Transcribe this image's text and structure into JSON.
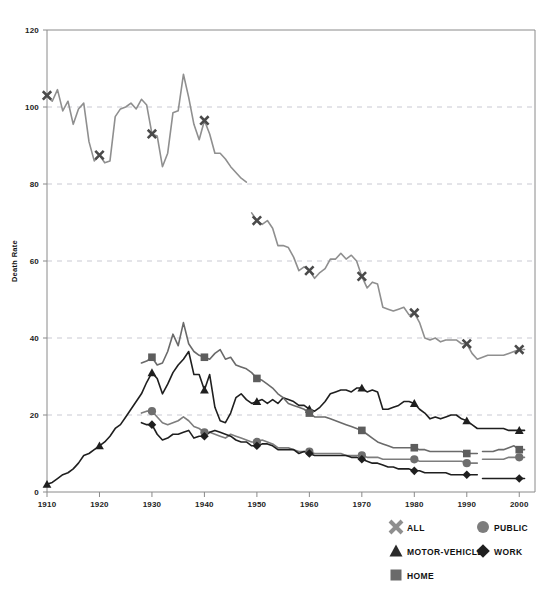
{
  "chart_data": {
    "type": "line",
    "title": "",
    "subtitle": "",
    "xlabel": "",
    "ylabel": "Death Rate",
    "xlim": [
      1910,
      2003
    ],
    "ylim": [
      0,
      120
    ],
    "y_ticks": [
      0,
      20,
      40,
      60,
      80,
      100,
      120
    ],
    "x_ticks": [
      1910,
      1920,
      1930,
      1940,
      1950,
      1960,
      1970,
      1980,
      1990,
      2000
    ],
    "grid": "horizontal-dashed",
    "legend_position": "bottom",
    "marker_interval_years": 10,
    "series": [
      {
        "name": "ALL",
        "marker": "x",
        "color": "#8f8f8f",
        "x": [
          1910,
          1911,
          1912,
          1913,
          1914,
          1915,
          1916,
          1917,
          1918,
          1919,
          1920,
          1921,
          1922,
          1923,
          1924,
          1925,
          1926,
          1927,
          1928,
          1929,
          1930,
          1931,
          1932,
          1933,
          1934,
          1935,
          1936,
          1937,
          1938,
          1939,
          1940,
          1941,
          1942,
          1943,
          1944,
          1945,
          1946,
          1947,
          1948
        ],
        "values": [
          103.0,
          101.5,
          104.5,
          99.0,
          101.5,
          95.5,
          99.5,
          101.0,
          91.0,
          86.0,
          87.5,
          85.5,
          86.0,
          97.5,
          99.5,
          100.0,
          101.0,
          99.5,
          102.0,
          100.5,
          93.0,
          92.5,
          84.5,
          88.0,
          98.5,
          99.0,
          108.5,
          102.5,
          95.5,
          91.5,
          96.5,
          93.0,
          88.0,
          88.0,
          86.5,
          84.5,
          83.0,
          81.5,
          80.5
        ]
      },
      {
        "name": "ALL",
        "segment": "post-1948-revision",
        "marker": "x",
        "color": "#8f8f8f",
        "x": [
          1949,
          1950,
          1951,
          1952,
          1953,
          1954,
          1955,
          1956,
          1957,
          1958,
          1959,
          1960,
          1961,
          1962,
          1963,
          1964,
          1965,
          1966,
          1967,
          1968,
          1969,
          1970,
          1971,
          1972,
          1973,
          1974,
          1975,
          1976,
          1977,
          1978,
          1979,
          1980,
          1981,
          1982,
          1983,
          1984,
          1985,
          1986,
          1987,
          1988,
          1989,
          1990,
          1991,
          1992,
          1993,
          1994,
          1995,
          1996,
          1997,
          1998,
          1999,
          2000,
          2001
        ],
        "values": [
          72.5,
          70.5,
          69.5,
          70.5,
          68.5,
          64.0,
          64.0,
          63.5,
          61.0,
          57.5,
          58.5,
          57.5,
          55.5,
          57.0,
          58.0,
          60.5,
          60.5,
          62.0,
          60.5,
          61.5,
          60.0,
          56.0,
          53.0,
          54.5,
          54.0,
          48.0,
          47.5,
          47.0,
          47.5,
          48.0,
          46.0,
          46.5,
          44.0,
          40.0,
          39.5,
          40.0,
          39.0,
          39.5,
          39.5,
          39.5,
          38.5,
          38.5,
          36.0,
          34.5,
          35.0,
          35.5,
          35.5,
          35.5,
          35.5,
          36.0,
          36.5,
          37.0,
          37.0
        ]
      },
      {
        "name": "MOTOR-VEHICLE",
        "marker": "triangle",
        "color": "#1f1f1f",
        "x": [
          1910,
          1911,
          1912,
          1913,
          1914,
          1915,
          1916,
          1917,
          1918,
          1919,
          1920,
          1921,
          1922,
          1923,
          1924,
          1925,
          1926,
          1927,
          1928,
          1929,
          1930,
          1931,
          1932,
          1933,
          1934,
          1935,
          1936,
          1937,
          1938,
          1939,
          1940,
          1941,
          1942,
          1943,
          1944,
          1945,
          1946,
          1947,
          1948,
          1949,
          1950,
          1951,
          1952,
          1953,
          1954,
          1955,
          1956,
          1957,
          1958,
          1959,
          1960,
          1961,
          1962,
          1963,
          1964,
          1965,
          1966,
          1967,
          1968,
          1969,
          1970,
          1971,
          1972,
          1973,
          1974,
          1975,
          1976,
          1977,
          1978,
          1979,
          1980,
          1981,
          1982,
          1983,
          1984,
          1985,
          1986,
          1987,
          1988,
          1989,
          1990,
          1991,
          1992,
          1993,
          1994,
          1995,
          1996,
          1997,
          1998,
          1999,
          2000,
          2001
        ],
        "values": [
          2.0,
          2.5,
          3.5,
          4.5,
          5.0,
          6.0,
          7.5,
          9.5,
          10.0,
          11.0,
          12.0,
          13.0,
          14.5,
          16.5,
          17.5,
          19.5,
          21.5,
          23.5,
          25.5,
          28.5,
          31.0,
          29.5,
          25.5,
          28.0,
          31.0,
          33.0,
          34.5,
          36.5,
          30.5,
          30.5,
          26.5,
          30.5,
          22.0,
          18.5,
          18.0,
          20.5,
          24.5,
          25.5,
          24.0,
          23.0,
          23.5,
          24.0,
          23.0,
          24.0,
          23.0,
          24.5,
          24.0,
          23.5,
          22.5,
          22.5,
          21.5,
          21.0,
          22.0,
          23.5,
          25.5,
          26.0,
          26.5,
          26.5,
          26.0,
          27.0,
          27.0,
          26.0,
          26.5,
          26.0,
          21.5,
          21.5,
          22.0,
          22.5,
          23.5,
          23.5,
          23.0,
          21.5,
          20.5,
          19.0,
          19.5,
          19.0,
          19.5,
          20.0,
          20.0,
          19.0,
          18.5,
          17.5,
          16.5,
          16.5,
          16.5,
          16.5,
          16.5,
          16.5,
          16.0,
          16.0,
          16.0,
          16.0
        ]
      },
      {
        "name": "HOME",
        "marker": "square",
        "color": "#6a6a6a",
        "x": [
          1928,
          1929,
          1930,
          1931,
          1932,
          1933,
          1934,
          1935,
          1936,
          1937,
          1938,
          1939,
          1940,
          1941,
          1942,
          1943,
          1944,
          1945,
          1946,
          1947,
          1948,
          1949,
          1950,
          1951,
          1952,
          1953,
          1954,
          1955,
          1956,
          1957,
          1958,
          1959,
          1960,
          1961,
          1962,
          1963,
          1964,
          1965,
          1966,
          1967,
          1968,
          1969,
          1970,
          1971,
          1972,
          1973,
          1974,
          1975,
          1976,
          1977,
          1978,
          1979,
          1980,
          1981,
          1982,
          1983,
          1984,
          1985,
          1986,
          1987,
          1988,
          1989,
          1990,
          1991,
          1992
        ],
        "values": [
          33.5,
          34.0,
          35.0,
          33.0,
          33.5,
          36.5,
          41.0,
          38.0,
          44.0,
          38.5,
          36.5,
          35.5,
          35.0,
          34.5,
          36.0,
          37.0,
          34.5,
          35.0,
          33.0,
          32.5,
          32.0,
          31.0,
          29.5,
          29.0,
          28.0,
          27.0,
          25.5,
          24.5,
          23.0,
          22.5,
          22.0,
          21.5,
          20.5,
          19.5,
          19.5,
          19.5,
          19.0,
          18.5,
          18.0,
          17.5,
          17.0,
          16.5,
          16.0,
          15.0,
          14.0,
          13.0,
          12.5,
          12.0,
          11.5,
          11.5,
          11.5,
          11.5,
          11.5,
          11.0,
          11.0,
          10.5,
          10.5,
          10.5,
          10.5,
          10.5,
          10.5,
          10.5,
          10.0,
          10.0,
          10.0
        ]
      },
      {
        "name": "HOME",
        "segment": "post-1992-revision",
        "marker": "square",
        "color": "#6a6a6a",
        "x": [
          1993,
          1994,
          1995,
          1996,
          1997,
          1998,
          1999,
          2000,
          2001
        ],
        "values": [
          10.5,
          10.5,
          10.5,
          11.0,
          11.0,
          11.5,
          12.0,
          11.0,
          11.0
        ]
      },
      {
        "name": "PUBLIC",
        "marker": "circle",
        "color": "#7d7d7d",
        "x": [
          1928,
          1929,
          1930,
          1931,
          1932,
          1933,
          1934,
          1935,
          1936,
          1937,
          1938,
          1939,
          1940,
          1941,
          1942,
          1943,
          1944,
          1945,
          1946,
          1947,
          1948,
          1949,
          1950,
          1951,
          1952,
          1953,
          1954,
          1955,
          1956,
          1957,
          1958,
          1959,
          1960,
          1961,
          1962,
          1963,
          1964,
          1965,
          1966,
          1967,
          1968,
          1969,
          1970,
          1971,
          1972,
          1973,
          1974,
          1975,
          1976,
          1977,
          1978,
          1979,
          1980,
          1981,
          1982,
          1983,
          1984,
          1985,
          1986,
          1987,
          1988,
          1989,
          1990,
          1991,
          1992
        ],
        "values": [
          20.5,
          21.0,
          21.0,
          19.5,
          18.0,
          17.5,
          18.0,
          18.5,
          19.5,
          18.5,
          17.0,
          16.5,
          15.5,
          15.5,
          15.0,
          14.5,
          14.0,
          15.0,
          14.5,
          14.0,
          13.5,
          13.0,
          13.0,
          13.5,
          13.0,
          12.5,
          11.5,
          11.5,
          11.5,
          11.0,
          10.5,
          10.5,
          10.5,
          10.0,
          10.0,
          10.0,
          10.0,
          10.0,
          10.0,
          9.5,
          9.5,
          9.5,
          9.5,
          9.0,
          9.0,
          9.0,
          8.5,
          8.5,
          8.5,
          8.5,
          8.5,
          8.5,
          8.5,
          8.0,
          8.0,
          8.0,
          8.0,
          8.0,
          8.0,
          8.0,
          8.0,
          8.0,
          7.5,
          7.5,
          7.5
        ]
      },
      {
        "name": "PUBLIC",
        "segment": "post-1992-revision",
        "marker": "circle",
        "color": "#7d7d7d",
        "x": [
          1993,
          1994,
          1995,
          1996,
          1997,
          1998,
          1999,
          2000,
          2001
        ],
        "values": [
          8.5,
          8.5,
          8.5,
          8.5,
          8.5,
          9.0,
          9.0,
          9.0,
          9.0
        ]
      },
      {
        "name": "WORK",
        "marker": "diamond",
        "color": "#1f1f1f",
        "x": [
          1928,
          1929,
          1930,
          1931,
          1932,
          1933,
          1934,
          1935,
          1936,
          1937,
          1938,
          1939,
          1940,
          1941,
          1942,
          1943,
          1944,
          1945,
          1946,
          1947,
          1948,
          1949,
          1950,
          1951,
          1952,
          1953,
          1954,
          1955,
          1956,
          1957,
          1958,
          1959,
          1960,
          1961,
          1962,
          1963,
          1964,
          1965,
          1966,
          1967,
          1968,
          1969,
          1970,
          1971,
          1972,
          1973,
          1974,
          1975,
          1976,
          1977,
          1978,
          1979,
          1980,
          1981,
          1982,
          1983,
          1984,
          1985,
          1986,
          1987,
          1988,
          1989,
          1990,
          1991,
          1992
        ],
        "values": [
          18.0,
          17.5,
          17.5,
          15.0,
          13.5,
          14.0,
          15.0,
          15.0,
          15.5,
          16.0,
          14.0,
          14.5,
          14.5,
          15.5,
          16.0,
          15.5,
          15.0,
          14.5,
          13.5,
          13.0,
          13.0,
          12.0,
          12.0,
          12.5,
          12.5,
          12.0,
          11.0,
          11.0,
          11.0,
          11.0,
          10.0,
          10.5,
          10.0,
          9.5,
          9.5,
          9.5,
          9.5,
          9.5,
          9.5,
          9.5,
          9.0,
          9.0,
          8.5,
          8.0,
          7.5,
          7.5,
          7.0,
          6.5,
          6.5,
          6.0,
          6.0,
          6.0,
          5.5,
          5.5,
          5.0,
          5.0,
          5.0,
          5.0,
          5.0,
          4.5,
          4.5,
          4.5,
          4.5,
          4.5,
          4.5
        ]
      },
      {
        "name": "WORK",
        "segment": "post-1992-revision",
        "marker": "diamond",
        "color": "#1f1f1f",
        "x": [
          1993,
          1994,
          1995,
          1996,
          1997,
          1998,
          1999,
          2000,
          2001
        ],
        "values": [
          3.5,
          3.5,
          3.5,
          3.5,
          3.5,
          3.5,
          3.5,
          3.5,
          3.5
        ]
      }
    ]
  },
  "axes": {
    "y_title": "Death Rate",
    "y_tick_labels": [
      "0",
      "20",
      "40",
      "60",
      "80",
      "100",
      "120"
    ],
    "x_tick_labels": [
      "1910",
      "1920",
      "1930",
      "1940",
      "1950",
      "1960",
      "1970",
      "1980",
      "1990",
      "2000"
    ]
  },
  "legend": {
    "entries": [
      {
        "label": "ALL",
        "marker": "x-marker",
        "color": "#8f8f8f"
      },
      {
        "label": "PUBLIC",
        "marker": "circle-marker",
        "color": "#7d7d7d"
      },
      {
        "label": "MOTOR-VEHICLE",
        "marker": "triangle-marker",
        "color": "#2a2a2a"
      },
      {
        "label": "WORK",
        "marker": "diamond-marker",
        "color": "#1f1f1f"
      },
      {
        "label": "HOME",
        "marker": "square-marker",
        "color": "#6a6a6a"
      }
    ]
  },
  "colors": {
    "all": "#8f8f8f",
    "motor_vehicle": "#1f1f1f",
    "home": "#6a6a6a",
    "public": "#7d7d7d",
    "work": "#1f1f1f",
    "grid": "#c9c9d2",
    "axis": "#8a8a8a",
    "background": "#ffffff"
  }
}
